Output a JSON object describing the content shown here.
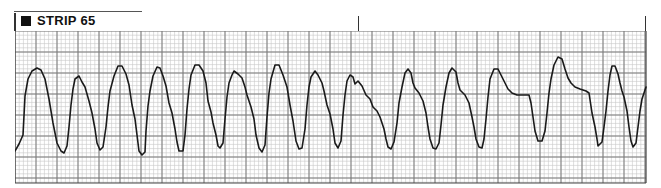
{
  "strip": {
    "label": "STRIP 65",
    "icon": "filled-square"
  },
  "grid": {
    "x": 15,
    "y": 31,
    "width": 631,
    "height": 152,
    "minor_px": 4.2,
    "major_px": 21,
    "minor_color": "#c8c8c8",
    "major_color": "#7a7a7a",
    "border_color": "#444444"
  },
  "markers": [
    {
      "x": 358,
      "top": 16,
      "height": 15
    },
    {
      "x": 645,
      "top": 16,
      "height": 15
    }
  ],
  "trace": {
    "color": "#1a1a1a",
    "points": "0,120 4,113 8,104 10,65 13,48 17,40 22,37 26,39 30,48 34,68 38,92 42,112 46,120 49,122 52,115 54,96 56,74 58,58 60,48 64,45 67,51 70,56 74,70 77,82 80,98 82,112 85,119 88,116 91,96 93,76 95,60 99,45 103,35 107,35 111,43 114,54 117,74 120,88 122,104 124,120 127,124 130,121 131,100 133,75 135,60 138,45 142,36 145,37 148,45 151,55 154,72 157,82 160,98 162,111 164,120 168,120 170,104 172,78 174,58 176,44 180,34 184,34 188,40 191,52 193,70 196,81 198,92 201,104 203,115 205,117 208,112 210,88 212,66 214,52 217,44 219,40 223,43 227,47 230,56 232,64 236,76 239,88 241,104 244,117 247,121 250,114 252,86 254,62 256,48 260,34 264,34 268,44 272,56 275,74 278,90 281,110 284,118 287,117 290,98 292,74 294,56 296,46 300,40 303,44 307,52 309,60 312,74 315,83 318,98 320,112 323,117 326,110 328,84 330,64 332,50 335,44 338,46 340,53 343,50 347,55 351,64 355,68 358,76 362,80 365,86 369,98 371,108 373,116 376,118 379,111 382,92 384,72 387,56 390,42 393,38 396,42 398,52 400,57 404,62 408,70 411,82 413,96 415,108 418,117 421,118 424,112 426,94 428,74 431,56 434,42 437,37 441,41 443,52 445,59 450,64 454,72 457,86 459,96 461,108 464,116 467,117 469,108 471,88 473,66 475,48 479,38 483,38 487,46 490,52 493,58 497,62 502,64 507,64 512,64 514,64 516,72 518,86 520,100 523,110 527,110 530,100 532,82 534,62 536,48 539,34 543,26 547,28 550,38 553,47 556,52 560,56 565,58 571,60 574,62 577,82 580,96 582,108 583,115 587,111 589,96 591,80 593,60 595,44 597,35 600,35 603,43 605,52 607,60 609,66 612,80 614,96 616,110 618,116 621,112 623,96 625,80 627,68 631,56"
  }
}
